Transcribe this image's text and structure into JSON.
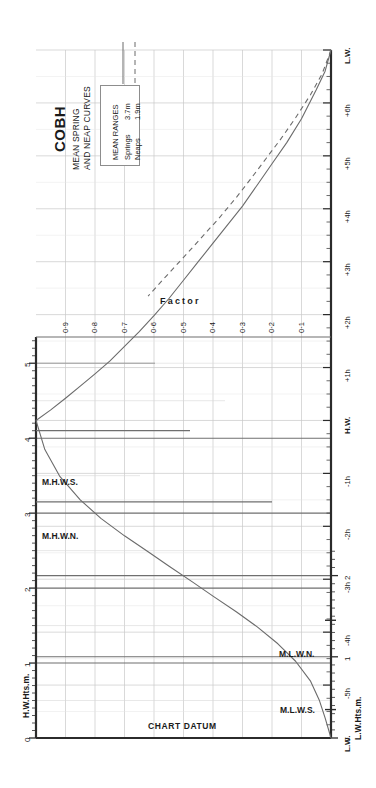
{
  "header": {
    "title": "COBH",
    "subtitle_line1": "MEAN SPRING",
    "subtitle_line2": "AND NEAP CURVES"
  },
  "legend": {
    "title": "MEAN RANGES",
    "rows": [
      {
        "name": "Springs",
        "value": "3.7m",
        "style": "solid"
      },
      {
        "name": "Neaps",
        "value": "1.9m",
        "style": "dashed"
      }
    ]
  },
  "axes": {
    "left_title": "H.W.Hts.m.",
    "right_title": "L.W.Hts.m.",
    "left_ticks": [
      "0",
      "1",
      "2",
      "3",
      "4",
      "5"
    ],
    "right_ticks": [
      "0",
      "1",
      "2"
    ],
    "time_labels": [
      "L.W.",
      "+6h",
      "+5h",
      "+4h",
      "+3h",
      "+2h",
      "+1h",
      "H.W.",
      "-1h",
      "-2h",
      "-3h",
      "-4h",
      "-5h",
      "L.W."
    ],
    "factor_title": "Factor",
    "factor_ticks": [
      "0·9",
      "0·8",
      "0·7",
      "0·6",
      "0·5",
      "0·4",
      "0·3",
      "0·2",
      "0·1"
    ]
  },
  "markers": {
    "mhws": "M.H.W.S.",
    "mhwn": "M.H.W.N.",
    "mlwn": "M.L.W.N.",
    "mlws": "M.L.W.S.",
    "chart_datum": "CHART DATUM"
  },
  "colors": {
    "frame": "#2b2b2b",
    "grid_major": "#6f6f6f",
    "grid_minor": "#c9c9c9",
    "curve": "#6b6b6b",
    "text": "#1a1a1a"
  },
  "chart_data": {
    "type": "line",
    "title": "COBH MEAN SPRING AND NEAP CURVES",
    "xlabel": "Factor",
    "ylabel": "Time from High Water / Low Water (hours)",
    "xlim": [
      0.0,
      1.0
    ],
    "ylim": [
      -6,
      7
    ],
    "grid": true,
    "legend_position": "top-left",
    "mean_ranges": {
      "springs_m": 3.7,
      "neaps_m": 1.9
    },
    "height_markers": {
      "M.H.W.S._m": 4.1,
      "M.H.W.N._m": 3.15,
      "M.L.W.N._m": 1.45,
      "M.L.W.S._m": 0.35,
      "chart_datum_m": 0.0
    },
    "series": [
      {
        "name": "Springs",
        "style": "solid",
        "points": [
          {
            "factor": 0.0,
            "t_hours": 7.0
          },
          {
            "factor": 0.02,
            "t_hours": 6.6
          },
          {
            "factor": 0.05,
            "t_hours": 6.25
          },
          {
            "factor": 0.1,
            "t_hours": 5.7
          },
          {
            "factor": 0.15,
            "t_hours": 5.25
          },
          {
            "factor": 0.2,
            "t_hours": 4.85
          },
          {
            "factor": 0.25,
            "t_hours": 4.45
          },
          {
            "factor": 0.3,
            "t_hours": 4.05
          },
          {
            "factor": 0.35,
            "t_hours": 3.7
          },
          {
            "factor": 0.4,
            "t_hours": 3.35
          },
          {
            "factor": 0.45,
            "t_hours": 3.0
          },
          {
            "factor": 0.5,
            "t_hours": 2.65
          },
          {
            "factor": 0.55,
            "t_hours": 2.3
          },
          {
            "factor": 0.6,
            "t_hours": 1.98
          },
          {
            "factor": 0.65,
            "t_hours": 1.68
          },
          {
            "factor": 0.7,
            "t_hours": 1.4
          },
          {
            "factor": 0.75,
            "t_hours": 1.12
          },
          {
            "factor": 0.8,
            "t_hours": 0.88
          },
          {
            "factor": 0.85,
            "t_hours": 0.65
          },
          {
            "factor": 0.9,
            "t_hours": 0.42
          },
          {
            "factor": 0.95,
            "t_hours": 0.2
          },
          {
            "factor": 1.0,
            "t_hours": 0.0
          },
          {
            "factor": 0.97,
            "t_hours": -0.55
          },
          {
            "factor": 0.92,
            "t_hours": -1.05
          },
          {
            "factor": 0.85,
            "t_hours": -1.5
          },
          {
            "factor": 0.78,
            "t_hours": -1.85
          },
          {
            "factor": 0.7,
            "t_hours": -2.18
          },
          {
            "factor": 0.62,
            "t_hours": -2.48
          },
          {
            "factor": 0.55,
            "t_hours": -2.75
          },
          {
            "factor": 0.47,
            "t_hours": -3.05
          },
          {
            "factor": 0.4,
            "t_hours": -3.32
          },
          {
            "factor": 0.32,
            "t_hours": -3.62
          },
          {
            "factor": 0.25,
            "t_hours": -3.9
          },
          {
            "factor": 0.18,
            "t_hours": -4.22
          },
          {
            "factor": 0.12,
            "t_hours": -4.55
          },
          {
            "factor": 0.07,
            "t_hours": -4.92
          },
          {
            "factor": 0.04,
            "t_hours": -5.28
          },
          {
            "factor": 0.02,
            "t_hours": -5.62
          },
          {
            "factor": 0.0,
            "t_hours": -6.0
          }
        ]
      },
      {
        "name": "Neaps",
        "style": "dashed",
        "points": [
          {
            "factor": 0.0,
            "t_hours": 7.0
          },
          {
            "factor": 0.03,
            "t_hours": 6.55
          },
          {
            "factor": 0.07,
            "t_hours": 6.15
          },
          {
            "factor": 0.12,
            "t_hours": 5.72
          },
          {
            "factor": 0.17,
            "t_hours": 5.32
          },
          {
            "factor": 0.22,
            "t_hours": 4.95
          },
          {
            "factor": 0.27,
            "t_hours": 4.58
          },
          {
            "factor": 0.32,
            "t_hours": 4.22
          },
          {
            "factor": 0.38,
            "t_hours": 3.82
          },
          {
            "factor": 0.44,
            "t_hours": 3.45
          },
          {
            "factor": 0.5,
            "t_hours": 3.08
          },
          {
            "factor": 0.56,
            "t_hours": 2.72
          },
          {
            "factor": 0.62,
            "t_hours": 2.35
          }
        ]
      }
    ]
  }
}
